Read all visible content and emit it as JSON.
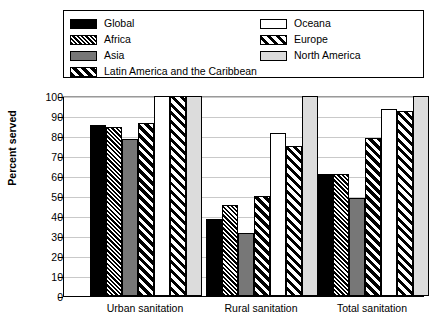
{
  "chart_data": {
    "type": "bar",
    "title": "",
    "xlabel": "",
    "ylabel": "Percent served",
    "ylim": [
      0,
      100
    ],
    "ytick_step": 10,
    "yticks": [
      0,
      10,
      20,
      30,
      40,
      50,
      60,
      70,
      80,
      90,
      100
    ],
    "grid": true,
    "legend_position": "top",
    "categories": [
      "Urban sanitation",
      "Rural sanitation",
      "Total sanitation"
    ],
    "series": [
      {
        "name": "Global",
        "pattern": "solid-black",
        "values": [
          85.5,
          38.5,
          61.0
        ]
      },
      {
        "name": "Africa",
        "pattern": "fine-diagonal",
        "values": [
          84.5,
          45.5,
          61.0
        ]
      },
      {
        "name": "Asia",
        "pattern": "solid-gray",
        "values": [
          78.5,
          31.5,
          49.0
        ]
      },
      {
        "name": "Latin America and the Caribbean",
        "pattern": "wide-diagonal",
        "values": [
          86.5,
          50.0,
          79.0
        ]
      },
      {
        "name": "Oceana",
        "pattern": "white",
        "values": [
          100.0,
          81.5,
          93.5
        ]
      },
      {
        "name": "Europe",
        "pattern": "diagonal-on-white",
        "values": [
          100.0,
          75.0,
          92.5
        ]
      },
      {
        "name": "North America",
        "pattern": "light-gray",
        "values": [
          100.0,
          100.0,
          100.0
        ]
      }
    ]
  },
  "legend": {
    "left_column": [
      {
        "label": "Global",
        "swatch": "p-global"
      },
      {
        "label": "Africa",
        "swatch": "p-africa"
      },
      {
        "label": "Asia",
        "swatch": "p-asia"
      },
      {
        "label": "Latin America and the Caribbean",
        "swatch": "p-latin"
      }
    ],
    "right_column": [
      {
        "label": "Oceana",
        "swatch": "p-oceana"
      },
      {
        "label": "Europe",
        "swatch": "p-europe"
      },
      {
        "label": "North America",
        "swatch": "p-northamerica"
      }
    ]
  },
  "colors": {
    "black": "#000000",
    "asia_gray": "#777777",
    "north_america_gray": "#dcdcdc",
    "gridline": "#c9c9c9"
  }
}
